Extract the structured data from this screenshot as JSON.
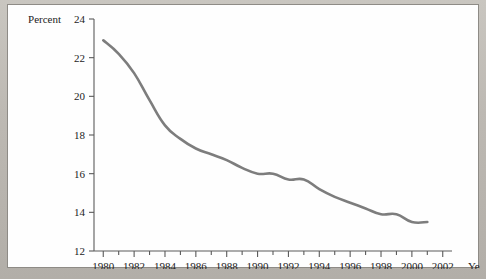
{
  "chart_data": {
    "type": "line",
    "title": "",
    "subtitle": "",
    "xlabel": "Year",
    "ylabel": "Percent",
    "xlim": [
      1979.4,
      2002.6
    ],
    "ylim": [
      12,
      24
    ],
    "grid": false,
    "legend": null,
    "x_tick_labels": [
      "1980",
      "1982",
      "1984",
      "1986",
      "1988",
      "1990",
      "1992",
      "1994",
      "1996",
      "1998",
      "2000",
      "2002"
    ],
    "x_tick_values": [
      1980,
      1982,
      1984,
      1986,
      1988,
      1990,
      1992,
      1994,
      1996,
      1998,
      2000,
      2002
    ],
    "x_minor_tick_values": [
      1981,
      1983,
      1985,
      1987,
      1989,
      1991,
      1993,
      1995,
      1997,
      1999,
      2001
    ],
    "y_tick_labels": [
      "12",
      "14",
      "16",
      "18",
      "20",
      "22",
      "24"
    ],
    "y_tick_values": [
      12,
      14,
      16,
      18,
      20,
      22,
      24
    ],
    "line_color": "#7d7d7d",
    "line_width": 2.6,
    "x": [
      1980,
      1981,
      1982,
      1983,
      1984,
      1985,
      1986,
      1987,
      1988,
      1989,
      1990,
      1991,
      1992,
      1993,
      1994,
      1995,
      1996,
      1997,
      1998,
      1999,
      2000,
      2001
    ],
    "values": [
      22.9,
      22.2,
      21.2,
      19.8,
      18.5,
      17.8,
      17.3,
      17.0,
      16.7,
      16.3,
      16.0,
      16.0,
      15.7,
      15.7,
      15.2,
      14.8,
      14.5,
      14.2,
      13.9,
      13.9,
      13.5,
      13.5
    ],
    "series": [
      {
        "name": "Percent",
        "values": [
          22.9,
          22.2,
          21.2,
          19.8,
          18.5,
          17.8,
          17.3,
          17.0,
          16.7,
          16.3,
          16.0,
          16.0,
          15.7,
          15.7,
          15.2,
          14.8,
          14.5,
          14.2,
          13.9,
          13.9,
          13.5,
          13.5
        ]
      }
    ]
  }
}
